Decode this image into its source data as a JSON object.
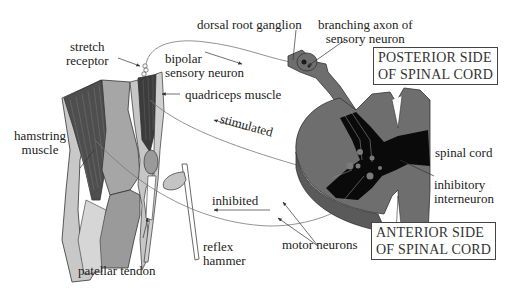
{
  "diagram": {
    "labels": {
      "stretch_receptor": [
        "stretch",
        "receptor"
      ],
      "bipolar_sensory_neuron": [
        "bipolar",
        "sensory neuron"
      ],
      "dorsal_root_ganglion": "dorsal root ganglion",
      "branching_axon": [
        "branching axon of",
        "sensory neuron"
      ],
      "quadriceps_muscle": "quadriceps muscle",
      "hamstring_muscle": [
        "hamstring",
        "muscle"
      ],
      "stimulated": "stimulated",
      "inhibited": "inhibited",
      "spinal_cord": "spinal cord",
      "inhibitory_interneuron": [
        "inhibitory",
        "interneuron"
      ],
      "motor_neurons": "motor neurons",
      "reflex_hammer": [
        "reflex",
        "hammer"
      ],
      "patellar_tendon": "patellar tendon"
    },
    "boxes": {
      "posterior": [
        "POSTERIOR SIDE",
        "OF SPINAL CORD"
      ],
      "anterior": [
        "ANTERIOR SIDE",
        "OF SPINAL CORD"
      ]
    },
    "colors": {
      "cord_gray": "#6e6e6e",
      "cord_dark": "#0a0a0a",
      "muscle_dark": "#4a4a4a",
      "bone_light": "#9a9a9a",
      "skin_light": "#c4c4c4",
      "line": "#555555"
    }
  }
}
